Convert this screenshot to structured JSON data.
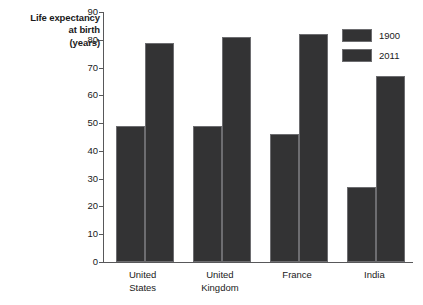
{
  "chart_data": {
    "type": "bar",
    "title": "",
    "xlabel": "",
    "ylabel": "Life expectancy at birth (years)",
    "ylabel_lines": [
      "Life expectancy",
      "at birth",
      "(years)"
    ],
    "categories": [
      "United States",
      "United Kingdom",
      "France",
      "India"
    ],
    "category_lines": [
      [
        "United",
        "States"
      ],
      [
        "United",
        "Kingdom"
      ],
      [
        "France",
        ""
      ],
      [
        "India",
        ""
      ]
    ],
    "series": [
      {
        "name": "1900",
        "values": [
          49,
          49,
          46,
          27
        ],
        "color": "#333334"
      },
      {
        "name": "2011",
        "values": [
          79,
          81,
          82,
          67
        ],
        "color": "#333334"
      }
    ],
    "ylim": [
      0,
      90
    ],
    "yticks": [
      0,
      10,
      20,
      30,
      40,
      50,
      60,
      70,
      80,
      90
    ],
    "ytick_labels": [
      "0",
      "10",
      "20",
      "30",
      "40",
      "50",
      "60",
      "70",
      "80",
      "90"
    ],
    "grid": false,
    "legend_position": "top-right",
    "legend_entries": [
      "1900",
      "2011"
    ],
    "axis_color": "#58585a",
    "background": "#ffffff"
  }
}
